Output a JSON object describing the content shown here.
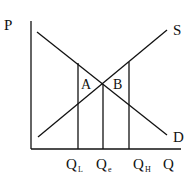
{
  "diagram": {
    "type": "supply-demand",
    "axes": {
      "y_label": "P",
      "x_label": "Q"
    },
    "curves": {
      "supply_label": "S",
      "demand_label": "D"
    },
    "regions": {
      "left_label": "A",
      "right_label": "B"
    },
    "quantities": {
      "low": {
        "main": "Q",
        "sub": "L"
      },
      "equilibrium": {
        "main": "Q",
        "sub": "e"
      },
      "high": {
        "main": "Q",
        "sub": "H"
      }
    },
    "colors": {
      "line": "#111111",
      "background": "#ffffff"
    }
  }
}
